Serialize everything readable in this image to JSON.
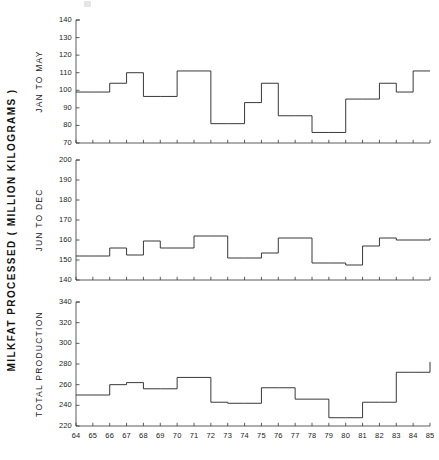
{
  "figure": {
    "axis_caption": "MILKFAT PROCESSED ( MILLION KILOGRAMS )",
    "xlabel": "",
    "line_color": "#222222",
    "axis_color": "#333333",
    "background": "#ffffff"
  },
  "xtick_labels": [
    "64",
    "65",
    "66",
    "67",
    "68",
    "69",
    "70",
    "71",
    "72",
    "73",
    "74",
    "75",
    "76",
    "77",
    "78",
    "79",
    "80",
    "81",
    "82",
    "83",
    "84",
    "85"
  ],
  "panels": [
    {
      "label": "JAN TO MAY",
      "yticks": [
        "70",
        "80",
        "90",
        "100",
        "110",
        "120",
        "130",
        "140"
      ]
    },
    {
      "label": "JUN TO DEC",
      "yticks": [
        "140",
        "150",
        "160",
        "170",
        "180",
        "190",
        "200"
      ]
    },
    {
      "label": "TOTAL PRODUCTION",
      "yticks": [
        "220",
        "240",
        "260",
        "280",
        "300",
        "320",
        "340"
      ]
    }
  ],
  "chart_data": [
    {
      "type": "line",
      "title": "",
      "subtitle": "JAN TO MAY",
      "xlabel": "",
      "ylabel": "MILKFAT PROCESSED ( MILLION KILOGRAMS )",
      "drawstyle": "steps-post",
      "grid": false,
      "legend": "none",
      "xlim": [
        64,
        85
      ],
      "ylim": [
        70,
        140
      ],
      "ytick_values": [
        70,
        80,
        90,
        100,
        110,
        120,
        130,
        140
      ],
      "x": [
        64,
        65,
        66,
        67,
        68,
        69,
        70,
        71,
        72,
        73,
        74,
        75,
        76,
        77,
        78,
        79,
        80,
        81,
        82,
        83,
        84,
        85
      ],
      "values": [
        99,
        99,
        104,
        110,
        96.5,
        96.5,
        111,
        111,
        81,
        81,
        93,
        104,
        85.5,
        85.5,
        76,
        76,
        95,
        95,
        104,
        99,
        111,
        111
      ]
    },
    {
      "type": "line",
      "title": "",
      "subtitle": "JUN TO DEC",
      "xlabel": "",
      "ylabel": "MILKFAT PROCESSED ( MILLION KILOGRAMS )",
      "drawstyle": "steps-post",
      "grid": false,
      "legend": "none",
      "xlim": [
        64,
        85
      ],
      "ylim": [
        140,
        200
      ],
      "ytick_values": [
        140,
        150,
        160,
        170,
        180,
        190,
        200
      ],
      "x": [
        64,
        65,
        66,
        67,
        68,
        69,
        70,
        71,
        72,
        73,
        74,
        75,
        76,
        77,
        78,
        79,
        80,
        81,
        82,
        83,
        84,
        85
      ],
      "values": [
        152,
        152,
        156,
        152.5,
        159.5,
        156,
        156,
        162,
        162,
        151,
        151,
        153.5,
        161,
        161,
        148.5,
        148.5,
        147.5,
        157,
        161,
        160,
        160,
        161
      ]
    },
    {
      "type": "line",
      "title": "",
      "subtitle": "TOTAL PRODUCTION",
      "xlabel": "",
      "ylabel": "MILKFAT PROCESSED ( MILLION KILOGRAMS )",
      "drawstyle": "steps-post",
      "grid": false,
      "legend": "none",
      "xlim": [
        64,
        85
      ],
      "ylim": [
        220,
        340
      ],
      "ytick_values": [
        220,
        240,
        260,
        280,
        300,
        320,
        340
      ],
      "x": [
        64,
        65,
        66,
        67,
        68,
        69,
        70,
        71,
        72,
        73,
        74,
        75,
        76,
        77,
        78,
        79,
        80,
        81,
        82,
        83,
        84,
        85
      ],
      "values": [
        250,
        250,
        260,
        262,
        256,
        256,
        267,
        267,
        243,
        242,
        242,
        257,
        257,
        246,
        246,
        228,
        228,
        243,
        243,
        272,
        272,
        282
      ]
    }
  ]
}
